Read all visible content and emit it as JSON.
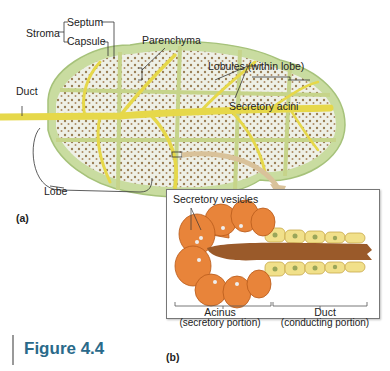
{
  "figure": {
    "title": "Figure 4.4",
    "panel_a_label": "(a)",
    "panel_b_label": "(b)"
  },
  "panel_a": {
    "labels": {
      "stroma": "Stroma",
      "septum": "Septum",
      "capsule": "Capsule",
      "parenchyma": "Parenchyma",
      "lobules": "Lobules (within lobe)",
      "secretory_acini": "Secretory acini",
      "duct": "Duct",
      "lobe": "Lobe"
    }
  },
  "panel_b": {
    "labels": {
      "secretory_vesicles": "Secretory vesicles",
      "acinus": "Acinus",
      "acinus_sub": "(secretory portion)",
      "duct": "Duct",
      "duct_sub": "(conducting portion)"
    }
  },
  "colors": {
    "capsule_green": "#c9dca0",
    "lobule_fill": "#eef0e6",
    "duct_yellow": "#e6d84a",
    "acinus_orange": "#e8843a",
    "duct_cell_yellow": "#f1e08a",
    "lumen_brown": "#9a5a2a",
    "title_blue": "#2a6a8a",
    "arrow_tan": "#d9c29a"
  }
}
